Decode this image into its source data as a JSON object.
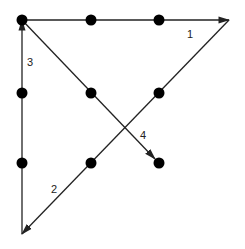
{
  "colors": {
    "line": "#222222",
    "dot": "#000000",
    "background": "#ffffff"
  },
  "dots": [
    {
      "x": 22,
      "y": 20
    },
    {
      "x": 91,
      "y": 20
    },
    {
      "x": 159,
      "y": 20
    },
    {
      "x": 22,
      "y": 93
    },
    {
      "x": 91,
      "y": 93
    },
    {
      "x": 159,
      "y": 93
    },
    {
      "x": 22,
      "y": 163
    },
    {
      "x": 91,
      "y": 163
    },
    {
      "x": 159,
      "y": 163
    }
  ],
  "lines": [
    {
      "label": "1",
      "from": [
        22,
        20
      ],
      "to": [
        229,
        20
      ],
      "label_pos": [
        187,
        38
      ]
    },
    {
      "label": "2",
      "from": [
        229,
        20
      ],
      "to": [
        22,
        234
      ],
      "label_pos": [
        51,
        193
      ]
    },
    {
      "label": "3",
      "from": [
        22,
        234
      ],
      "to": [
        22,
        20
      ],
      "label_pos": [
        27,
        66
      ]
    },
    {
      "label": "4",
      "from": [
        22,
        20
      ],
      "to": [
        155,
        159
      ],
      "label_pos": [
        140,
        139
      ]
    }
  ]
}
